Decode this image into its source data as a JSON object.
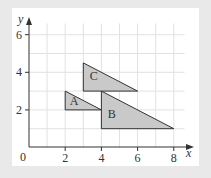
{
  "diagram": {
    "type": "coordinate-grid-triangles",
    "axes": {
      "x_label": "x",
      "y_label": "y",
      "origin_label": "0",
      "x_ticks": [
        "2",
        "4",
        "6",
        "8"
      ],
      "y_ticks": [
        "2",
        "4",
        "6"
      ],
      "x_range": [
        0,
        8.5
      ],
      "y_range": [
        0,
        6.5
      ]
    },
    "shapes": [
      {
        "label": "A",
        "vertices": [
          [
            2,
            2
          ],
          [
            2,
            3
          ],
          [
            4,
            2
          ]
        ]
      },
      {
        "label": "B",
        "vertices": [
          [
            4,
            1
          ],
          [
            4,
            3
          ],
          [
            8,
            1
          ]
        ]
      },
      {
        "label": "C",
        "vertices": [
          [
            3,
            3
          ],
          [
            3,
            4.5
          ],
          [
            6,
            3
          ]
        ]
      }
    ],
    "colors": {
      "background": "#e9e9e9",
      "panel": "#ffffff",
      "grid": "#e2e2e2",
      "axis": "#333333",
      "shape_fill": "#c9c9c9",
      "shape_stroke": "#333333"
    }
  }
}
